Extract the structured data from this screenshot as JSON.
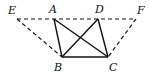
{
  "diagram": {
    "type": "geometry-figure",
    "points": {
      "E": {
        "label": "E",
        "x": 17,
        "y": 19,
        "lx": 8,
        "ly": 14
      },
      "A": {
        "label": "A",
        "x": 54,
        "y": 19,
        "lx": 49,
        "ly": 13
      },
      "D": {
        "label": "D",
        "x": 98,
        "y": 19,
        "lx": 95,
        "ly": 13
      },
      "F": {
        "label": "F",
        "x": 136,
        "y": 19,
        "lx": 137,
        "ly": 14
      },
      "B": {
        "label": "B",
        "x": 62,
        "y": 57,
        "lx": 54,
        "ly": 71
      },
      "C": {
        "label": "C",
        "x": 108,
        "y": 57,
        "lx": 109,
        "ly": 71
      }
    },
    "solid_segments": [
      "AB",
      "BC",
      "CD",
      "AC",
      "BD"
    ],
    "dashed_segments": [
      "EF",
      "EB",
      "FC"
    ]
  }
}
